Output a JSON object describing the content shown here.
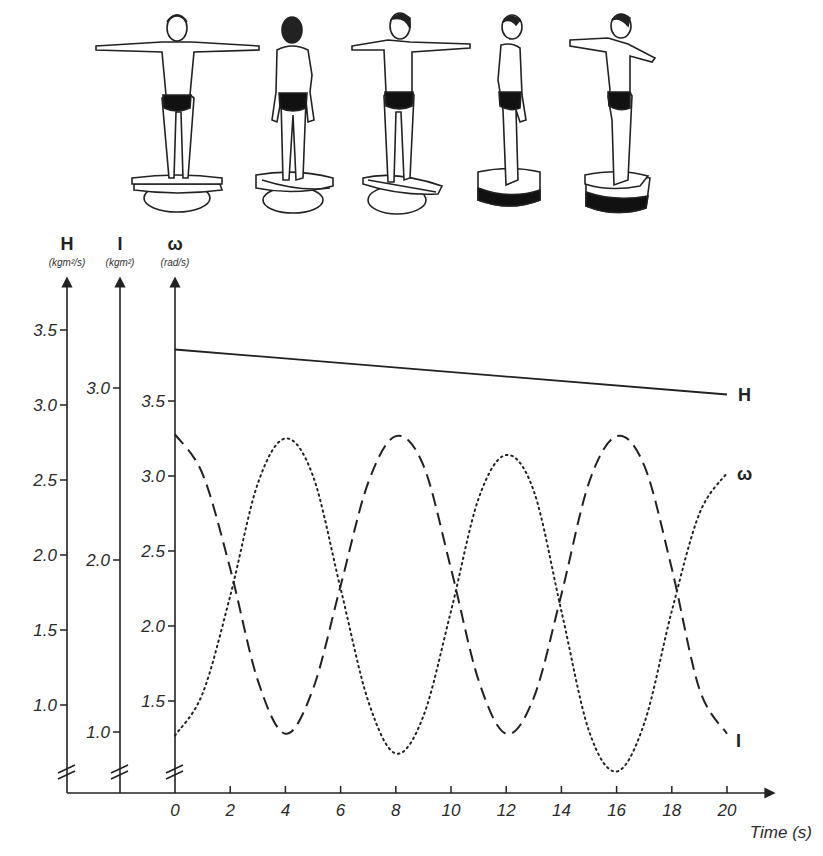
{
  "figures": {
    "count": 5,
    "items": [
      {
        "pose": "front-arms-out",
        "label": "figure-front"
      },
      {
        "pose": "back-arms-down",
        "label": "figure-back"
      },
      {
        "pose": "three-quarter-arms-out",
        "label": "figure-three-quarter"
      },
      {
        "pose": "side-arms-down",
        "label": "figure-side"
      },
      {
        "pose": "side-arms-out",
        "label": "figure-side-arms-out"
      }
    ]
  },
  "colors": {
    "ink": "#222222",
    "background": "#ffffff"
  },
  "chart_data": {
    "type": "line",
    "title": "",
    "xlabel": "Time (s)",
    "x_ticks": [
      0,
      2,
      4,
      6,
      8,
      10,
      12,
      14,
      16,
      18,
      20
    ],
    "xlim": [
      0,
      20
    ],
    "grid": false,
    "legend": "inline labels at line ends",
    "axes": [
      {
        "id": "H",
        "symbol": "H",
        "unit": "(kgm²/s)",
        "ticks": [
          "1.0",
          "1.5",
          "2.0",
          "2.5",
          "3.0",
          "3.5"
        ],
        "tick_values": [
          1.0,
          1.5,
          2.0,
          2.5,
          3.0,
          3.5
        ],
        "broken": true
      },
      {
        "id": "I",
        "symbol": "I",
        "unit": "(kgm²)",
        "ticks": [
          "1.0",
          "2.0",
          "3.0"
        ],
        "tick_values": [
          1.0,
          2.0,
          3.0
        ],
        "broken": true
      },
      {
        "id": "omega",
        "symbol": "ω",
        "unit": "(rad/s)",
        "ticks": [
          "1.5",
          "2.0",
          "2.5",
          "3.0",
          "3.5"
        ],
        "tick_values": [
          1.5,
          2.0,
          2.5,
          3.0,
          3.5
        ],
        "broken": true
      }
    ],
    "series": [
      {
        "name": "H",
        "label": "H",
        "axis": "H",
        "style": "solid",
        "x": [
          0,
          20
        ],
        "values": [
          3.37,
          3.07
        ]
      },
      {
        "name": "I",
        "label": "I",
        "axis": "I",
        "style": "dashed",
        "x": [
          0,
          1,
          2,
          3,
          4,
          5,
          6,
          7,
          8,
          9,
          10,
          11,
          12,
          13,
          14,
          15,
          16,
          17,
          18,
          19,
          20
        ],
        "values": [
          2.73,
          2.5,
          1.95,
          1.3,
          0.99,
          1.25,
          1.85,
          2.45,
          2.72,
          2.55,
          1.95,
          1.3,
          0.99,
          1.2,
          1.8,
          2.45,
          2.72,
          2.55,
          1.95,
          1.25,
          0.99
        ]
      },
      {
        "name": "ω",
        "label": "ω",
        "axis": "omega",
        "style": "dotted",
        "x": [
          0,
          1,
          2,
          3,
          4,
          5,
          6,
          7,
          8,
          9,
          10,
          11,
          12,
          13,
          14,
          15,
          16,
          17,
          18,
          19,
          20
        ],
        "values": [
          1.27,
          1.55,
          2.2,
          2.95,
          3.25,
          3.0,
          2.25,
          1.5,
          1.15,
          1.4,
          2.1,
          2.85,
          3.14,
          2.9,
          2.1,
          1.3,
          1.03,
          1.35,
          2.1,
          2.75,
          3.02
        ]
      }
    ]
  }
}
